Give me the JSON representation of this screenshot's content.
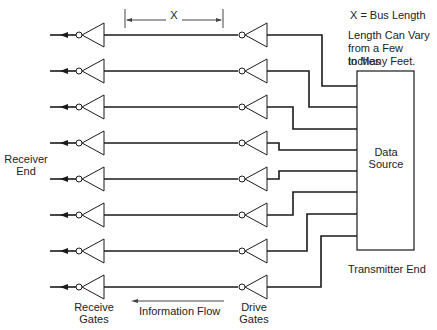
{
  "diagram": {
    "dimension_label": "X",
    "legend": {
      "definition": "X = Bus Length",
      "note_lines": [
        "Length Can Vary",
        "from a Few Inches",
        "to Many Feet."
      ]
    },
    "box": {
      "line1": "Data",
      "line2": "Source"
    },
    "transmitter_label": "Transmitter End",
    "receiver_label": {
      "line1": "Receiver",
      "line2": "End"
    },
    "receive_gates": {
      "line1": "Receive",
      "line2": "Gates"
    },
    "drive_gates": {
      "line1": "Drive",
      "line2": "Gates"
    },
    "flow_label": "Information Flow",
    "rows": [
      {
        "y": 35,
        "jog_x": 322,
        "box_y": 86
      },
      {
        "y": 71,
        "jog_x": 309,
        "box_y": 107
      },
      {
        "y": 107,
        "jog_x": 293,
        "box_y": 129
      },
      {
        "y": 143,
        "jog_x": 279,
        "box_y": 150
      },
      {
        "y": 179,
        "jog_x": 279,
        "box_y": 171
      },
      {
        "y": 215,
        "jog_x": 293,
        "box_y": 192
      },
      {
        "y": 251,
        "jog_x": 307,
        "box_y": 214
      },
      {
        "y": 287,
        "jog_x": 321,
        "box_y": 236
      }
    ]
  }
}
